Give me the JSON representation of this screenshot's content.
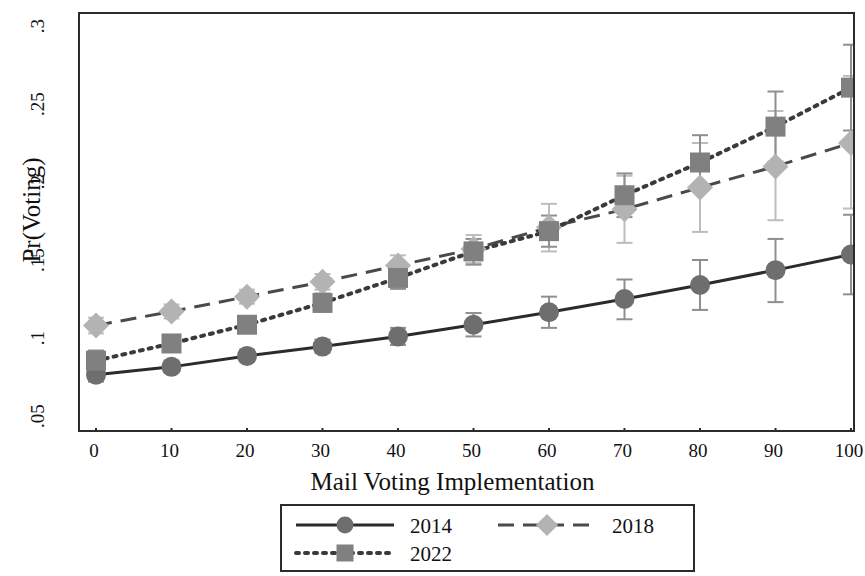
{
  "chart_data": {
    "type": "line",
    "title": "",
    "xlabel": "Mail Voting Implementation",
    "ylabel": "Pr(Voting)",
    "x": [
      0,
      10,
      20,
      30,
      40,
      50,
      60,
      70,
      80,
      90,
      100
    ],
    "xlim": [
      0,
      100
    ],
    "ylim": [
      0.05,
      0.3
    ],
    "xticks": [
      "0",
      "10",
      "20",
      "30",
      "40",
      "50",
      "60",
      "70",
      "80",
      "90",
      "100"
    ],
    "yticks": [
      ".05",
      ".1",
      ".15",
      ".2",
      ".25",
      ".3"
    ],
    "ytick_values": [
      0.05,
      0.1,
      0.15,
      0.2,
      0.25,
      0.3
    ],
    "grid": false,
    "legend_position": "below-center",
    "error_bars": "95% confidence intervals",
    "series": [
      {
        "name": "2014",
        "color": "#6e6e6e",
        "line_style": "solid",
        "marker": "circle",
        "values": [
          0.0765,
          0.0815,
          0.0885,
          0.0945,
          0.101,
          0.1085,
          0.1165,
          0.125,
          0.134,
          0.1435,
          0.1535
        ],
        "ci_low": [
          0.072,
          0.078,
          0.085,
          0.0905,
          0.0955,
          0.101,
          0.1065,
          0.112,
          0.118,
          0.123,
          0.128
        ],
        "ci_high": [
          0.081,
          0.0855,
          0.0925,
          0.099,
          0.1065,
          0.116,
          0.1265,
          0.1375,
          0.15,
          0.1635,
          0.179
        ]
      },
      {
        "name": "2018",
        "color": "#b3b3b3",
        "line_style": "dashed",
        "marker": "diamond",
        "values": [
          0.108,
          0.117,
          0.1265,
          0.136,
          0.1465,
          0.157,
          0.171,
          0.1825,
          0.1965,
          0.21,
          0.225
        ],
        "ci_low": [
          0.103,
          0.1125,
          0.122,
          0.131,
          0.14,
          0.148,
          0.1555,
          0.161,
          0.168,
          0.1755,
          0.183
        ],
        "ci_high": [
          0.113,
          0.1215,
          0.131,
          0.141,
          0.153,
          0.166,
          0.186,
          0.204,
          0.225,
          0.2455,
          0.268
        ]
      },
      {
        "name": "2022",
        "color": "#808080",
        "line_style": "dotted",
        "marker": "square",
        "values": [
          0.0855,
          0.0965,
          0.1085,
          0.1225,
          0.1385,
          0.1555,
          0.1685,
          0.1915,
          0.2125,
          0.2355,
          0.2605
        ],
        "ci_low": [
          0.079,
          0.0915,
          0.1035,
          0.117,
          0.1315,
          0.147,
          0.1585,
          0.1775,
          0.1945,
          0.213,
          0.233
        ],
        "ci_high": [
          0.092,
          0.1015,
          0.114,
          0.1285,
          0.1455,
          0.1635,
          0.1785,
          0.2055,
          0.23,
          0.258,
          0.288
        ]
      }
    ]
  },
  "axis": {
    "y_title": "Pr(Voting)",
    "x_title": "Mail Voting Implementation"
  },
  "legend": {
    "entries": [
      {
        "label": "2014"
      },
      {
        "label": "2018"
      },
      {
        "label": "2022"
      }
    ]
  }
}
